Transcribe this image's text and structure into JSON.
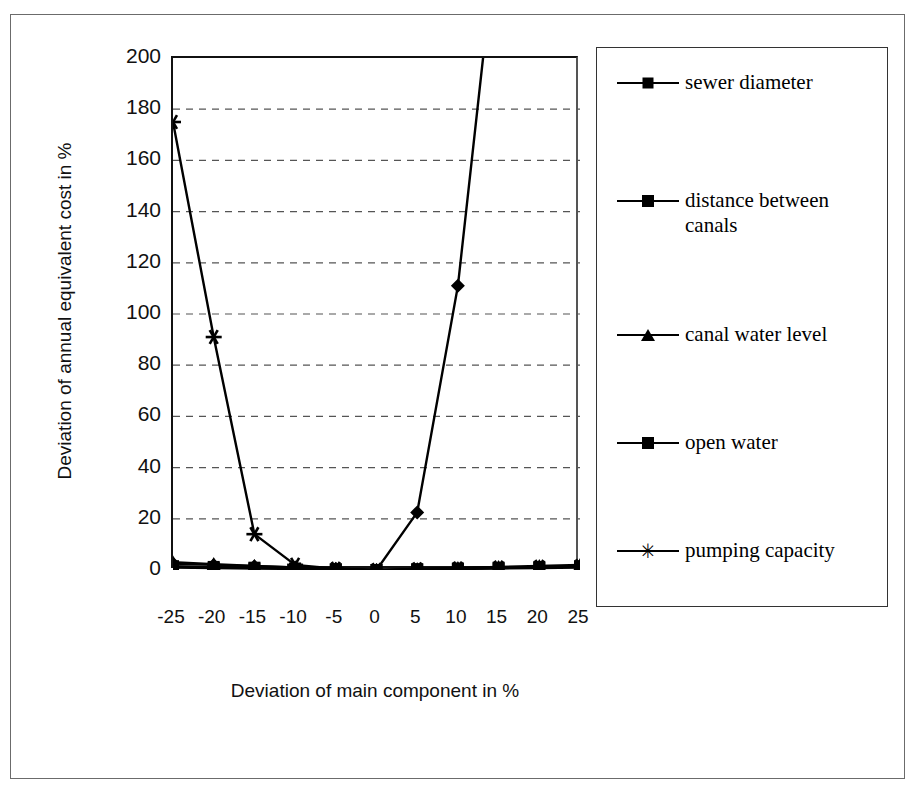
{
  "chart_data": {
    "type": "line",
    "title": "",
    "xlabel": "Deviation of main component in %",
    "ylabel": "Deviation of annual equivalent cost in %",
    "x": [
      -25,
      -20,
      -15,
      -10,
      -5,
      0,
      5,
      10,
      15,
      20,
      25
    ],
    "categories": [
      "-25",
      "-20",
      "-15",
      "-10",
      "-5",
      "0",
      "5",
      "10",
      "15",
      "20",
      "25"
    ],
    "xlim": [
      -25,
      25
    ],
    "ylim": [
      0,
      200
    ],
    "yticks": [
      0,
      20,
      40,
      60,
      80,
      100,
      120,
      140,
      160,
      180,
      200
    ],
    "grid": "horizontal-dashed",
    "legend_position": "right-outside",
    "series": [
      {
        "name": "sewer diameter",
        "marker": "diamond",
        "values": [
          2.5,
          2.0,
          1.5,
          1.0,
          0.5,
          0.0,
          22.5,
          111.0,
          255.0,
          255.0,
          255.0
        ]
      },
      {
        "name": "distance between canals",
        "marker": "square",
        "values": [
          1.5,
          1.2,
          0.9,
          0.6,
          0.3,
          0.0,
          0.3,
          0.6,
          0.9,
          1.2,
          1.5
        ]
      },
      {
        "name": "canal water level",
        "marker": "triangle",
        "values": [
          3.0,
          2.3,
          1.6,
          1.0,
          0.4,
          0.0,
          0.4,
          0.8,
          1.2,
          1.6,
          2.0
        ]
      },
      {
        "name": "open water",
        "marker": "square",
        "values": [
          1.0,
          0.8,
          0.6,
          0.4,
          0.2,
          0.0,
          0.2,
          0.4,
          0.6,
          0.8,
          1.0
        ]
      },
      {
        "name": "pumping capacity",
        "marker": "star",
        "values": [
          175.0,
          91.0,
          14.0,
          2.0,
          0.5,
          0.0,
          0.3,
          0.6,
          0.9,
          1.2,
          1.5
        ]
      }
    ],
    "colors": {
      "line": "#000000",
      "grid": "#555555",
      "axis": "#111111",
      "background": "#ffffff"
    }
  }
}
